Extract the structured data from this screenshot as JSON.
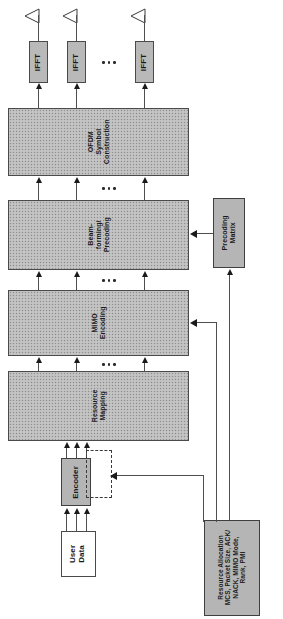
{
  "diagram": {
    "orientation": "rotated-90",
    "antennas": [
      {
        "name": "antenna-1"
      },
      {
        "name": "antenna-2"
      },
      {
        "name": "antenna-n"
      }
    ],
    "ifft_blocks": [
      {
        "label": "IFFT"
      },
      {
        "label": "IFFT"
      },
      {
        "label": "IFFT"
      }
    ],
    "stages": [
      {
        "id": "ofdm",
        "line1": "OFDM",
        "line2": "Symbol",
        "line3": "Construction"
      },
      {
        "id": "beamforming",
        "line1": "Beam-",
        "line2": "forming/",
        "line3": "Precoding"
      },
      {
        "id": "mimo",
        "line1": "MIMO",
        "line2": "Encoding",
        "line3": ""
      },
      {
        "id": "resource",
        "line1": "Resource",
        "line2": "Mapping",
        "line3": ""
      }
    ],
    "encoder": {
      "label": "Encoder"
    },
    "user_data": {
      "line1": "User",
      "line2": "Data"
    },
    "precoding_matrix": {
      "line1": "Precoding",
      "line2": "Matrix"
    },
    "control_info": {
      "line1": "Resource Allocation",
      "line2": "MCS, Packet Size, ACK/",
      "line3": "NACK, MIMO Mode,",
      "line4": "Rank, PMI"
    },
    "ellipsis": "...",
    "colors": {
      "stage_fill": "#bdbdbd",
      "solid_fill": "#b9b9b9",
      "outline": "#4a4a4a",
      "arrow": "#1a1a1a",
      "background": "#ffffff"
    }
  }
}
